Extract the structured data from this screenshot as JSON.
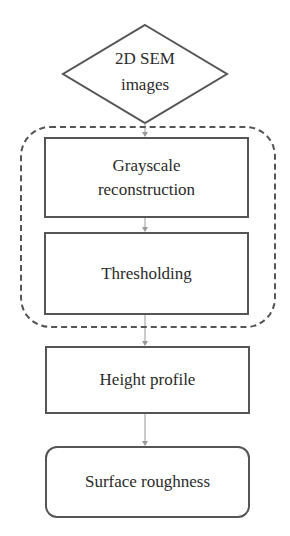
{
  "diagram": {
    "type": "flowchart",
    "nodes": [
      {
        "id": "input",
        "shape": "diamond",
        "label_line1": "2D SEM",
        "label_line2": "images"
      },
      {
        "id": "grayscale",
        "shape": "rectangle",
        "label_line1": "Grayscale",
        "label_line2": "reconstruction"
      },
      {
        "id": "thresholding",
        "shape": "rectangle",
        "label": "Thresholding"
      },
      {
        "id": "height",
        "shape": "rectangle",
        "label": "Height profile"
      },
      {
        "id": "roughness",
        "shape": "rounded-rectangle",
        "label": "Surface roughness"
      }
    ],
    "groups": [
      {
        "id": "processing-group",
        "style": "dashed-rounded",
        "contains": [
          "grayscale",
          "thresholding"
        ]
      }
    ],
    "edges": [
      {
        "from": "input",
        "to": "grayscale"
      },
      {
        "from": "grayscale",
        "to": "thresholding"
      },
      {
        "from": "thresholding",
        "to": "height"
      },
      {
        "from": "height",
        "to": "roughness"
      }
    ],
    "colors": {
      "stroke": "#555555",
      "arrow": "#999999",
      "text": "#2b2b2b",
      "background": "#ffffff"
    }
  }
}
